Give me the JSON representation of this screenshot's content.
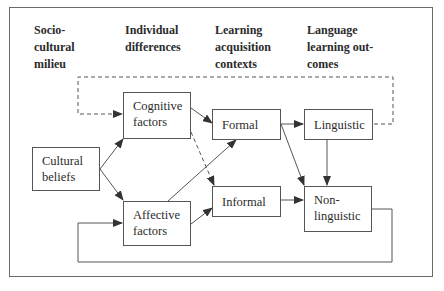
{
  "columns": [
    {
      "id": "sociocultural",
      "label": "Socio-\ncultural\nmilieu"
    },
    {
      "id": "individual",
      "label": "Individual\ndifferences"
    },
    {
      "id": "contexts",
      "label": "Learning\nacquisition\ncontexts"
    },
    {
      "id": "outcomes",
      "label": "Language\nlearning out-\ncomes"
    }
  ],
  "nodes": {
    "cultural": {
      "label": "Cultural\nbeliefs"
    },
    "cognitive": {
      "label": "Cognitive\nfactors"
    },
    "affective": {
      "label": "Affective\nfactors"
    },
    "formal": {
      "label": "Formal"
    },
    "informal": {
      "label": "Informal"
    },
    "linguistic": {
      "label": "Linguistic"
    },
    "nonlinguistic": {
      "label": "Non-\nlinguistic"
    }
  },
  "edges": [
    {
      "from": "cultural",
      "to": "cognitive",
      "style": "solid"
    },
    {
      "from": "cultural",
      "to": "affective",
      "style": "solid"
    },
    {
      "from": "cognitive",
      "to": "formal",
      "style": "solid"
    },
    {
      "from": "cognitive",
      "to": "informal",
      "style": "dashed"
    },
    {
      "from": "affective",
      "to": "formal",
      "style": "solid"
    },
    {
      "from": "affective",
      "to": "informal",
      "style": "solid"
    },
    {
      "from": "formal",
      "to": "linguistic",
      "style": "solid"
    },
    {
      "from": "formal",
      "to": "nonlinguistic",
      "style": "solid"
    },
    {
      "from": "informal",
      "to": "nonlinguistic",
      "style": "solid"
    },
    {
      "from": "linguistic",
      "to": "nonlinguistic",
      "style": "solid"
    },
    {
      "from": "linguistic",
      "to": "cognitive",
      "style": "dashed",
      "note": "feedback loop over top"
    },
    {
      "from": "nonlinguistic",
      "to": "affective",
      "style": "solid",
      "note": "feedback loop along bottom"
    }
  ],
  "colors": {
    "line": "#555555",
    "text": "#2b2b2b",
    "frame": "#6a6a6a"
  }
}
